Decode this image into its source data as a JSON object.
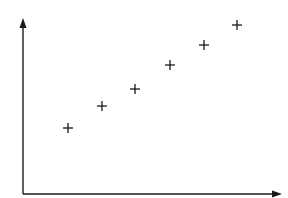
{
  "chart_data": {
    "type": "scatter",
    "title": "",
    "xlabel": "",
    "ylabel": "",
    "marker": "plus",
    "grid": false,
    "legend": null,
    "axis_style": "arrows, no ticks, no labels",
    "xlim": [
      0,
      259
    ],
    "ylim": [
      0,
      176
    ],
    "series": [
      {
        "name": "points",
        "color": "#1a1a1a",
        "x": [
          45,
          79,
          112,
          147,
          181,
          214
        ],
        "y": [
          66,
          88,
          105,
          129,
          149,
          169
        ]
      }
    ]
  },
  "layout": {
    "origin_px": [
      23,
      194
    ],
    "x_axis_end_px": 282,
    "y_axis_end_px": 18,
    "marker_half_size_px": 5
  }
}
